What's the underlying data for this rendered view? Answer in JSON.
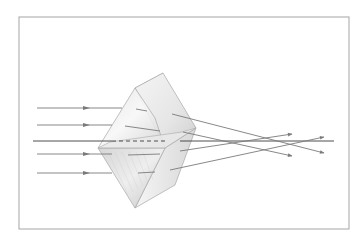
{
  "diagram": {
    "title": "",
    "colors": {
      "background": "#ffffff",
      "frame": "#b4b4b4",
      "ray": "#7a7a7a",
      "axis": "#3a3a3a",
      "prism_light": "#f2f2f2",
      "prism_mid": "#dcdcdc",
      "prism_dark": "#bdbdbd",
      "prism_edge": "#a8a8a8"
    },
    "frame": {
      "x": 19,
      "y": 17,
      "w": 330,
      "h": 212
    },
    "axis": {
      "x1": 33,
      "y1": 141,
      "x2": 334,
      "y2": 141
    },
    "axis_dashed_inside_prism": {
      "x1": 112,
      "y1": 141,
      "x2": 165,
      "y2": 141
    },
    "incident_rays": [
      {
        "label": "ray-1",
        "x1": 37,
        "y1": 108,
        "x2": 122,
        "y2": 108,
        "arrow_x": 88
      },
      {
        "label": "ray-2",
        "x1": 37,
        "y1": 125,
        "x2": 112,
        "y2": 125,
        "arrow_x": 88
      },
      {
        "label": "ray-4",
        "x1": 37,
        "y1": 154,
        "x2": 112,
        "y2": 154,
        "arrow_x": 88
      },
      {
        "label": "ray-5",
        "x1": 37,
        "y1": 173,
        "x2": 112,
        "y2": 173,
        "arrow_x": 88
      }
    ],
    "internal_rays": [
      {
        "x1": 136,
        "y1": 109,
        "x2": 147,
        "y2": 111
      },
      {
        "x1": 125,
        "y1": 126,
        "x2": 160,
        "y2": 131
      },
      {
        "x1": 128,
        "y1": 155,
        "x2": 160,
        "y2": 154
      },
      {
        "x1": 138,
        "y1": 173,
        "x2": 155,
        "y2": 172
      }
    ],
    "emergent_rays": [
      {
        "label": "ray-1-out",
        "x1": 172,
        "y1": 114,
        "x2": 324,
        "y2": 153,
        "arrow": true
      },
      {
        "label": "ray-2-out",
        "x1": 183,
        "y1": 132,
        "x2": 292,
        "y2": 156,
        "arrow": true
      },
      {
        "label": "ray-4-out",
        "x1": 180,
        "y1": 151,
        "x2": 292,
        "y2": 134,
        "arrow": true
      },
      {
        "label": "ray-5-out",
        "x1": 170,
        "y1": 170,
        "x2": 324,
        "y2": 137,
        "arrow": true
      }
    ],
    "prism": {
      "upper_left_face": "135,88 98,148 165,148 155,118",
      "upper_top_face": "135,88 163,73 196,128 165,148",
      "upper_back_face": "135,88 163,73 150,98",
      "lower_left_face": "98,148 165,148 135,208",
      "lower_right_face": "165,148 196,128 175,185 135,208",
      "base_band": "98,148 165,148 196,128 182,132 110,142"
    }
  }
}
